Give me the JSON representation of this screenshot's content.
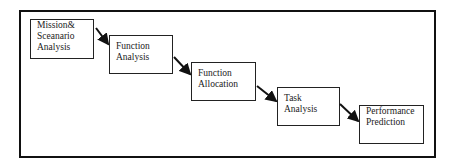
{
  "diagram": {
    "type": "waterfall-process",
    "steps": [
      {
        "lines": [
          "Mission&",
          "Sceanario",
          "Analysis"
        ]
      },
      {
        "lines": [
          "Function",
          "Analysis"
        ]
      },
      {
        "lines": [
          "Function",
          "Allocation"
        ]
      },
      {
        "lines": [
          "Task",
          "Analysis"
        ]
      },
      {
        "lines": [
          "Performance",
          "Prediction"
        ]
      }
    ],
    "colors": {
      "stroke": "#111111",
      "background": "#ffffff"
    }
  }
}
